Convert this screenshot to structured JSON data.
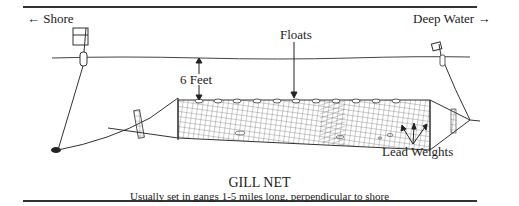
{
  "diagram": {
    "title": "GILL NET",
    "caption": "Usually set in gangs 1-5 miles long, perpendicular to shore",
    "labels": {
      "shore": "← Shore",
      "deep_water": "Deep Water →",
      "floats": "Floats",
      "depth": "6 Feet",
      "lead_weights": "Lead Weights"
    }
  }
}
